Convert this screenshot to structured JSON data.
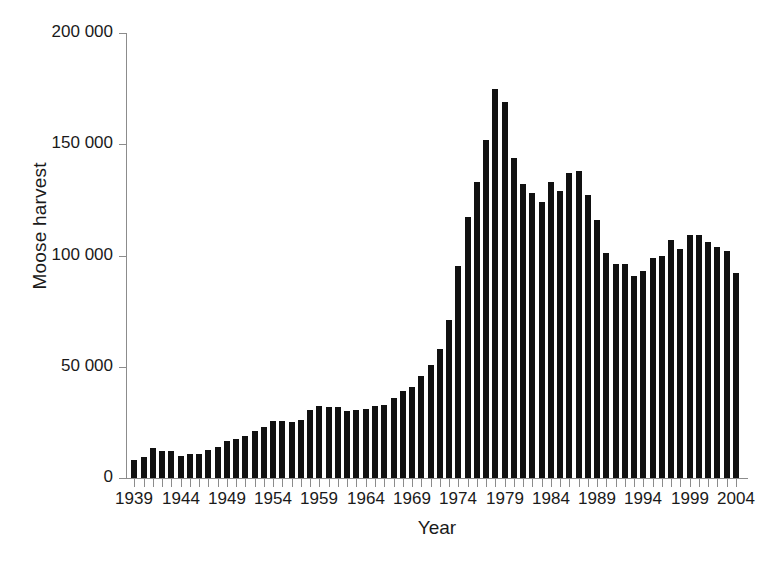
{
  "chart_data": {
    "type": "bar",
    "title": "",
    "xlabel": "Year",
    "ylabel": "Moose harvest",
    "xlim": [
      1938.2,
      2005.2
    ],
    "ylim": [
      0,
      200000
    ],
    "grid": false,
    "legend": null,
    "bar_color": "#111111",
    "axis_color": "#8c8c8c",
    "ytick_values": [
      0,
      50000,
      100000,
      150000,
      200000
    ],
    "ytick_labels": [
      "0",
      "50 000",
      "100 000",
      "150 000",
      "200 000"
    ],
    "xtick_labels": [
      "1939",
      "1944",
      "1949",
      "1954",
      "1959",
      "1964",
      "1969",
      "1974",
      "1979",
      "1984",
      "1989",
      "1994",
      "1999",
      "2004"
    ],
    "xtick_values": [
      1939,
      1944,
      1949,
      1954,
      1959,
      1964,
      1969,
      1974,
      1979,
      1984,
      1989,
      1994,
      1999,
      2004
    ],
    "categories": [
      1939,
      1940,
      1941,
      1942,
      1943,
      1944,
      1945,
      1946,
      1947,
      1948,
      1949,
      1950,
      1951,
      1952,
      1953,
      1954,
      1955,
      1956,
      1957,
      1958,
      1959,
      1960,
      1961,
      1962,
      1963,
      1964,
      1965,
      1966,
      1967,
      1968,
      1969,
      1970,
      1971,
      1972,
      1973,
      1974,
      1975,
      1976,
      1977,
      1978,
      1979,
      1980,
      1981,
      1982,
      1983,
      1984,
      1985,
      1986,
      1987,
      1988,
      1989,
      1990,
      1991,
      1992,
      1993,
      1994,
      1995,
      1996,
      1997,
      1998,
      1999,
      2000,
      2001,
      2002,
      2003,
      2004
    ],
    "values": [
      8000,
      9500,
      13500,
      12000,
      12000,
      10000,
      11000,
      11000,
      12500,
      14000,
      16500,
      17500,
      19000,
      21000,
      23000,
      25500,
      25500,
      25000,
      26000,
      30500,
      32500,
      32000,
      32000,
      30000,
      30500,
      31000,
      32500,
      33000,
      36000,
      39000,
      41000,
      46000,
      51000,
      58000,
      71000,
      95500,
      117500,
      133000,
      152000,
      175000,
      169000,
      144000,
      132000,
      128000,
      124000,
      133000,
      129000,
      137000,
      138000,
      127000,
      116000,
      101000,
      96000,
      96000,
      91000,
      93000,
      99000,
      100000,
      107000,
      103000,
      109000,
      109000,
      106000,
      104000,
      102000,
      92000
    ]
  },
  "axes": {
    "ylabel_text": "Moose harvest",
    "xlabel_text": "Year"
  }
}
